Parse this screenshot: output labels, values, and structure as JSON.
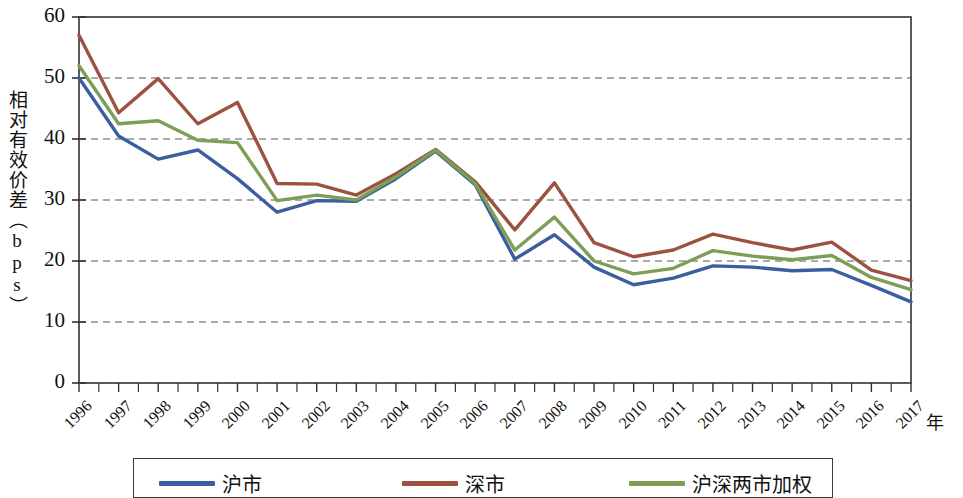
{
  "chart_data": {
    "type": "line",
    "title": "",
    "xlabel": "年",
    "ylabel": "相对有效价差（bps）",
    "xlim": [
      1996,
      2017
    ],
    "ylim": [
      0,
      60
    ],
    "ytick_values": [
      0,
      10,
      20,
      30,
      40,
      50,
      60
    ],
    "ytick_labels": [
      "0",
      "10",
      "20",
      "30",
      "40",
      "50",
      "60"
    ],
    "grid": "horizontal-dashed",
    "legend_position": "bottom",
    "categories": [
      1996,
      1997,
      1998,
      1999,
      2000,
      2001,
      2002,
      2003,
      2004,
      2005,
      2006,
      2007,
      2008,
      2009,
      2010,
      2011,
      2012,
      2013,
      2014,
      2015,
      2016,
      2017
    ],
    "xtick_labels": [
      "1996",
      "1997",
      "1998",
      "1999",
      "2000",
      "2001",
      "2002",
      "2003",
      "2004",
      "2005",
      "2006",
      "2007",
      "2008",
      "2009",
      "2010",
      "2011",
      "2012",
      "2013",
      "2014",
      "2015",
      "2016",
      "2017"
    ],
    "series": [
      {
        "name": "沪市",
        "color": "#3b5e9e",
        "values": [
          50.0,
          40.5,
          36.7,
          38.2,
          33.5,
          28.0,
          29.9,
          29.8,
          33.5,
          38.0,
          32.5,
          20.3,
          24.3,
          19.0,
          16.1,
          17.2,
          19.2,
          19.0,
          18.4,
          18.6,
          16.0,
          13.3
        ]
      },
      {
        "name": "深市",
        "color": "#9b5240",
        "values": [
          57.0,
          44.3,
          49.9,
          42.5,
          46.0,
          32.7,
          32.6,
          30.8,
          34.3,
          38.3,
          33.0,
          25.1,
          32.8,
          23.0,
          20.7,
          21.8,
          24.4,
          23.0,
          21.8,
          23.1,
          18.5,
          16.8
        ]
      },
      {
        "name": "沪深两市加权",
        "color": "#7d9e55",
        "values": [
          52.0,
          42.5,
          43.0,
          39.8,
          39.4,
          29.9,
          30.8,
          30.0,
          33.8,
          38.2,
          32.7,
          21.8,
          27.2,
          20.0,
          17.9,
          18.8,
          21.7,
          20.8,
          20.2,
          20.9,
          17.3,
          15.3
        ]
      }
    ]
  },
  "legend": {
    "items": [
      {
        "label": "沪市",
        "color": "#3b5e9e"
      },
      {
        "label": "深市",
        "color": "#9b5240"
      },
      {
        "label": "沪深两市加权",
        "color": "#7d9e55"
      }
    ]
  },
  "axes": {
    "y_title": "相对有效价差（bps）",
    "x_title": "年"
  }
}
